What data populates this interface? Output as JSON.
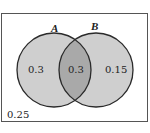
{
  "diagram": {
    "type": "venn",
    "sets": [
      {
        "name": "A",
        "label": "A"
      },
      {
        "name": "B",
        "label": "B"
      }
    ],
    "regions": {
      "a_only": "0.3",
      "a_and_b": "0.3",
      "b_only": "0.15",
      "outside": "0.25"
    },
    "colors": {
      "circle_fill": "#cfcfcf",
      "overlap_fill": "#a9a9a9",
      "stroke": "#2a2a2a",
      "box_stroke": "#555555",
      "background": "#ffffff"
    }
  }
}
